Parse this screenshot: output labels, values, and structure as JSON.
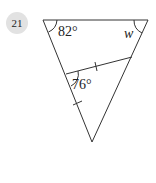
{
  "problem": {
    "number": "21"
  },
  "figure": {
    "angle_top_left": "82°",
    "angle_top_right": "w",
    "angle_interior": "76°",
    "line_color": "#333333"
  }
}
